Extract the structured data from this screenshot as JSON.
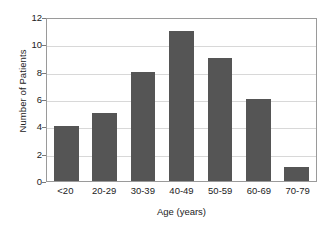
{
  "chart_data": {
    "type": "bar",
    "title": "",
    "xlabel": "Age (years)",
    "ylabel": "Number of Patients",
    "categories": [
      "<20",
      "20-29",
      "30-39",
      "40-49",
      "50-59",
      "60-69",
      "70-79"
    ],
    "values": [
      4,
      5,
      8,
      11,
      9,
      6,
      1
    ],
    "ylim": [
      0,
      12
    ],
    "ytick_values": [
      0,
      2,
      4,
      6,
      8,
      10,
      12
    ],
    "ytick_labels": [
      "0",
      "2",
      "4",
      "6",
      "8",
      "10",
      "12"
    ],
    "grid": "horizontal",
    "legend": "none",
    "bar_color": "#555555",
    "gridline_color": "#d8d8d8",
    "frame_color": "#9a9a9a",
    "background_color": "#ffffff"
  }
}
